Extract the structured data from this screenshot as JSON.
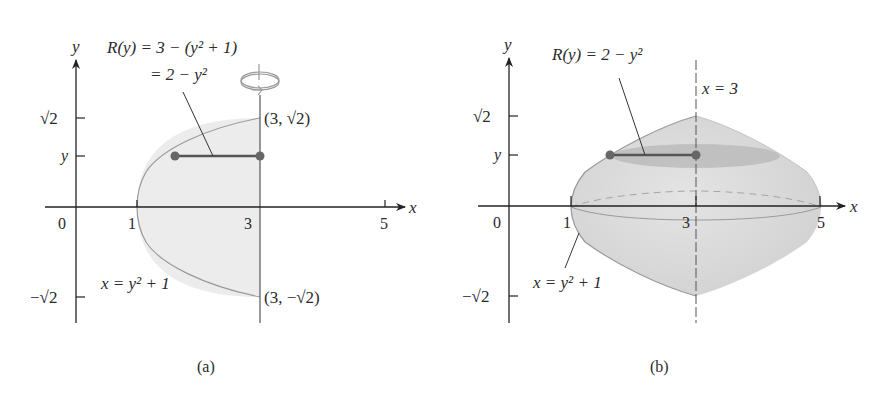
{
  "figure": {
    "panels": [
      {
        "id": "a",
        "caption": "(a)",
        "axes": {
          "x_label": "x",
          "y_label": "y",
          "x_ticks": [
            "0",
            "1",
            "3",
            "5"
          ],
          "y_ticks": [
            "√2",
            "y",
            "−√2"
          ]
        },
        "annotations": {
          "radius_line1": "R(y) = 3 − (y² + 1)",
          "radius_line2": "= 2 − y²",
          "point_top": "(3, √2)",
          "point_bottom": "(3, −√2)",
          "curve": "x = y² + 1"
        },
        "rotation_icon": "rotate-about-axis-icon"
      },
      {
        "id": "b",
        "caption": "(b)",
        "axes": {
          "x_label": "x",
          "y_label": "y",
          "x_ticks": [
            "0",
            "1",
            "3",
            "5"
          ],
          "y_ticks": [
            "√2",
            "y",
            "−√2"
          ]
        },
        "annotations": {
          "radius": "R(y) = 2 − y²",
          "axis_of_rotation": "x = 3",
          "curve": "x = y² + 1"
        }
      }
    ],
    "colors": {
      "region_fill": "#e9e9e9",
      "solid_fill": "#d6d6d6",
      "disk_fill": "#b4b4b4",
      "curve_stroke": "#9a9a9a",
      "segment": "#555555",
      "dot": "#666666",
      "axis": "#222222"
    }
  }
}
